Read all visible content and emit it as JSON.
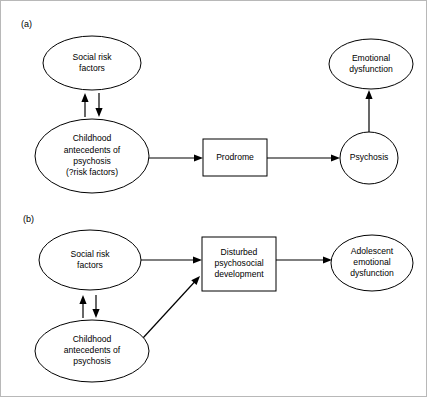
{
  "figure": {
    "width": 427,
    "height": 397,
    "background_color": "#ffffff",
    "stroke_color": "#000000",
    "type": "flowchart"
  },
  "panels": [
    {
      "id": "panel-a",
      "label": "(a)",
      "label_x": 20,
      "label_y": 24,
      "nodes": [
        {
          "id": "a-social-risk-factors",
          "name": "social-risk-factors",
          "shape": "ellipse",
          "cx": 91,
          "cy": 62,
          "rx": 49,
          "ry": 27,
          "lines": [
            "Social risk",
            "factors"
          ]
        },
        {
          "id": "a-childhood-antecedents",
          "name": "childhood-antecedents-of-psychosis",
          "shape": "ellipse",
          "cx": 91,
          "cy": 155,
          "rx": 57,
          "ry": 37,
          "lines": [
            "Childhood",
            "antecedents of",
            "psychosis",
            "(?risk factors)"
          ]
        },
        {
          "id": "a-prodrome",
          "name": "prodrome",
          "shape": "rect",
          "x": 202,
          "y": 138,
          "width": 64,
          "height": 37,
          "lines": [
            "Prodrome"
          ]
        },
        {
          "id": "a-psychosis",
          "name": "psychosis",
          "shape": "ellipse",
          "cx": 368,
          "cy": 157,
          "rx": 29,
          "ry": 26,
          "lines": [
            "Psychosis"
          ]
        },
        {
          "id": "a-emotional-dysfunction",
          "name": "emotional-dysfunction",
          "shape": "ellipse",
          "cx": 370,
          "cy": 63,
          "rx": 42,
          "ry": 25,
          "lines": [
            "Emotional",
            "dysfunction"
          ]
        }
      ],
      "edges": [
        {
          "id": "a-edge-child-to-social",
          "name": "arrow-childhood-to-social-risk",
          "from": "a-childhood-antecedents",
          "to": "a-social-risk-factors",
          "direction": "up",
          "x1": 84,
          "y1": 116,
          "x2": 84,
          "y2": 92
        },
        {
          "id": "a-edge-social-to-child",
          "name": "arrow-social-risk-to-childhood",
          "from": "a-social-risk-factors",
          "to": "a-childhood-antecedents",
          "direction": "down",
          "x1": 98,
          "y1": 92,
          "x2": 98,
          "y2": 116
        },
        {
          "id": "a-edge-child-to-prodrome",
          "name": "arrow-childhood-to-prodrome",
          "from": "a-childhood-antecedents",
          "to": "a-prodrome",
          "direction": "right",
          "x1": 148,
          "y1": 157,
          "x2": 202,
          "y2": 157
        },
        {
          "id": "a-edge-prodrome-to-psychosis",
          "name": "arrow-prodrome-to-psychosis",
          "from": "a-prodrome",
          "to": "a-psychosis",
          "direction": "right",
          "x1": 266,
          "y1": 157,
          "x2": 339,
          "y2": 157
        },
        {
          "id": "a-edge-psychosis-to-emotional",
          "name": "arrow-psychosis-to-emotional-dysfunction",
          "from": "a-psychosis",
          "to": "a-emotional-dysfunction",
          "direction": "up",
          "x1": 368,
          "y1": 131,
          "x2": 368,
          "y2": 89
        }
      ]
    },
    {
      "id": "panel-b",
      "label": "(b)",
      "label_x": 22,
      "label_y": 219,
      "nodes": [
        {
          "id": "b-social-risk-factors",
          "name": "social-risk-factors",
          "shape": "ellipse",
          "cx": 89,
          "cy": 259,
          "rx": 51,
          "ry": 30,
          "lines": [
            "Social risk",
            "factors"
          ]
        },
        {
          "id": "b-childhood-antecedents",
          "name": "childhood-antecedents-of-psychosis",
          "shape": "ellipse",
          "cx": 91,
          "cy": 350,
          "rx": 57,
          "ry": 31,
          "lines": [
            "Childhood",
            "antecedents of",
            "psychosis"
          ]
        },
        {
          "id": "b-disturbed-development",
          "name": "disturbed-psychosocial-development",
          "shape": "rect",
          "x": 201,
          "y": 236,
          "width": 74,
          "height": 54,
          "lines": [
            "Disturbed",
            "psychosocial",
            "development"
          ]
        },
        {
          "id": "b-adolescent-dysfunction",
          "name": "adolescent-emotional-dysfunction",
          "shape": "ellipse",
          "cx": 371,
          "cy": 262,
          "rx": 41,
          "ry": 28,
          "lines": [
            "Adolescent",
            "emotional",
            "dysfunction"
          ]
        }
      ],
      "edges": [
        {
          "id": "b-edge-child-to-social",
          "name": "arrow-childhood-to-social-risk",
          "from": "b-childhood-antecedents",
          "to": "b-social-risk-factors",
          "direction": "up",
          "x1": 82,
          "y1": 317,
          "x2": 82,
          "y2": 294
        },
        {
          "id": "b-edge-social-to-child",
          "name": "arrow-social-risk-to-childhood",
          "from": "b-social-risk-factors",
          "to": "b-childhood-antecedents",
          "direction": "down",
          "x1": 95,
          "y1": 294,
          "x2": 95,
          "y2": 317
        },
        {
          "id": "b-edge-social-to-disturbed",
          "name": "arrow-social-risk-to-disturbed-development",
          "from": "b-social-risk-factors",
          "to": "b-disturbed-development",
          "direction": "right",
          "x1": 140,
          "y1": 259,
          "x2": 201,
          "y2": 259
        },
        {
          "id": "b-edge-child-to-disturbed",
          "name": "arrow-childhood-to-disturbed-development",
          "from": "b-childhood-antecedents",
          "to": "b-disturbed-development",
          "direction": "diagonal-up-right",
          "x1": 142,
          "y1": 337,
          "x2": 199,
          "y2": 275
        },
        {
          "id": "b-edge-disturbed-to-adolescent",
          "name": "arrow-disturbed-development-to-adolescent-dysfunction",
          "from": "b-disturbed-development",
          "to": "b-adolescent-dysfunction",
          "direction": "right",
          "x1": 275,
          "y1": 259,
          "x2": 331,
          "y2": 259
        }
      ]
    }
  ]
}
